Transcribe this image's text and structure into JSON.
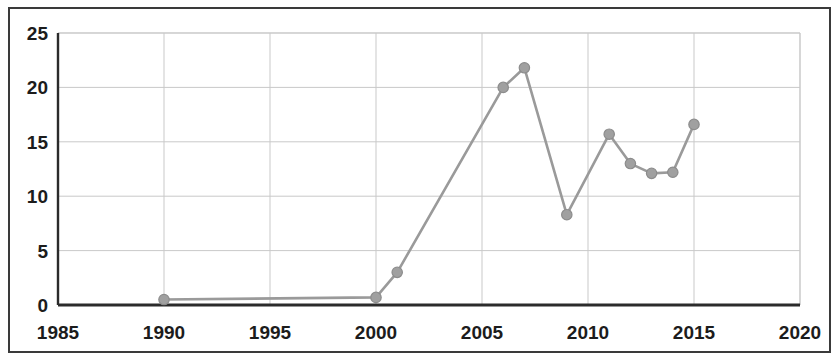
{
  "chart_data": {
    "type": "line",
    "title": "",
    "subtitle": "",
    "xlabel": "",
    "ylabel": "",
    "xlim": [
      1985,
      2020
    ],
    "ylim": [
      0,
      25
    ],
    "grid": true,
    "legend": null,
    "legend_position": "none",
    "x_ticks": [
      "1985",
      "1990",
      "1995",
      "2000",
      "2005",
      "2010",
      "2015",
      "2020"
    ],
    "x_tick_values": [
      1985,
      1990,
      1995,
      2000,
      2005,
      2010,
      2015,
      2020
    ],
    "y_ticks": [
      "0",
      "5",
      "10",
      "15",
      "20",
      "25"
    ],
    "y_tick_values": [
      0,
      5,
      10,
      15,
      20,
      25
    ],
    "marker": "circle",
    "series": [
      {
        "name": "series-1",
        "color": "#9a9a9a",
        "x": [
          1990,
          2000,
          2001,
          2006,
          2007,
          2009,
          2011,
          2012,
          2013,
          2014,
          2015
        ],
        "values": [
          0.5,
          0.7,
          3.0,
          20.0,
          21.8,
          8.3,
          15.7,
          13.0,
          12.1,
          12.2,
          16.6
        ]
      }
    ]
  },
  "style": {
    "line_color": "#9a9a9a",
    "marker_color": "#a0a0a0",
    "marker_edge_color": "#8c8c8c",
    "grid_color": "#c9c9c9",
    "axis_color": "#2b2b2b",
    "frame_color": "#3a3a3a",
    "text_color": "#1c1c1c",
    "background_color": "#ffffff"
  }
}
